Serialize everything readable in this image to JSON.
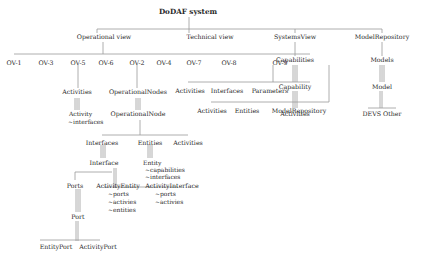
{
  "diagram": {
    "root": "DoDAF system",
    "views": {
      "operational": "Operational view",
      "technical": "Technical view",
      "systems": "SystemsView",
      "repository": "ModelRepository"
    },
    "ov_items": [
      "OV-1",
      "OV-3",
      "OV-5",
      "OV-6",
      "OV-2",
      "OV-4",
      "OV-7",
      "OV-8",
      "OV-9"
    ],
    "ov5": {
      "child": "Activities",
      "grandchild": "Activity",
      "attrs": [
        "~interfaces"
      ]
    },
    "ov2": {
      "child": "OperationalNodes",
      "grandchild": "OperationalNode",
      "node_children": [
        "Interfaces",
        "Entities",
        "Activities"
      ],
      "interface": "Interface",
      "entity": "Entity",
      "entity_attrs": [
        "~capabilities",
        "~interfaces"
      ],
      "interface_children": [
        "Ports",
        "ActivityEntity",
        "ActivityInterface"
      ],
      "activity_entity_attrs": [
        "~ports",
        "~activies",
        "~entities"
      ],
      "activity_interface_attrs": [
        "~ports",
        "~activies"
      ],
      "port": "Port",
      "port_children": [
        "EntityPort",
        "ActivityPort"
      ]
    },
    "ov8": {
      "children": [
        "Activities",
        "Interfaces",
        "Parameters"
      ]
    },
    "ov9": {
      "children": [
        "Activities",
        "Entities",
        "ModelRepository"
      ]
    },
    "systems": {
      "child": "Capabilities",
      "grandchild": "Capability",
      "leaf": "Activities"
    },
    "repository": {
      "child": "Models",
      "grandchild": "Model",
      "leaf": "DEVS Other"
    }
  }
}
